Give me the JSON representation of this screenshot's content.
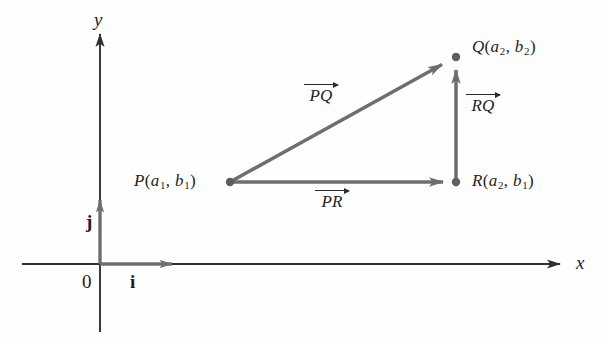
{
  "figure": {
    "background_color": "#fefefe",
    "stroke_color": "#6e6e6e",
    "axis_color": "#3a3a3a",
    "text_color": "#1f1f1f"
  },
  "axes": {
    "x_label": "x",
    "y_label": "y",
    "origin_label": "0",
    "basis_i_label": "i",
    "basis_j_label": "j",
    "origin_px": {
      "x": 100,
      "y": 264
    },
    "x_axis_from_px": 22,
    "x_axis_to_px": 566,
    "y_axis_from_px": 330,
    "y_axis_to_px": 30
  },
  "points": [
    {
      "name": "P",
      "label_point": "P",
      "coord_first": "a",
      "coord_first_sub": "1",
      "coord_second": "b",
      "coord_second_sub": "1",
      "px": {
        "x": 230,
        "y": 182
      }
    },
    {
      "name": "Q",
      "label_point": "Q",
      "coord_first": "a",
      "coord_first_sub": "2",
      "coord_second": "b",
      "coord_second_sub": "2",
      "px": {
        "x": 456,
        "y": 57
      }
    },
    {
      "name": "R",
      "label_point": "R",
      "coord_first": "a",
      "coord_first_sub": "2",
      "coord_second": "b",
      "coord_second_sub": "1",
      "px": {
        "x": 456,
        "y": 182
      }
    }
  ],
  "vectors": [
    {
      "name": "PQ",
      "label": "PQ",
      "from": "P",
      "to": "Q",
      "label_px": {
        "x": 304,
        "y": 86
      }
    },
    {
      "name": "RQ",
      "label": "RQ",
      "from": "R",
      "to": "Q",
      "label_px": {
        "x": 466,
        "y": 96
      }
    },
    {
      "name": "PR",
      "label": "PR",
      "from": "P",
      "to": "R",
      "label_px": {
        "x": 315,
        "y": 192
      }
    }
  ],
  "basis_vectors": [
    {
      "name": "i",
      "label": "i",
      "from_px": {
        "x": 100,
        "y": 264
      },
      "to_px": {
        "x": 185,
        "y": 264
      }
    },
    {
      "name": "j",
      "label": "j",
      "from_px": {
        "x": 100,
        "y": 264
      },
      "to_px": {
        "x": 100,
        "y": 188
      }
    }
  ]
}
